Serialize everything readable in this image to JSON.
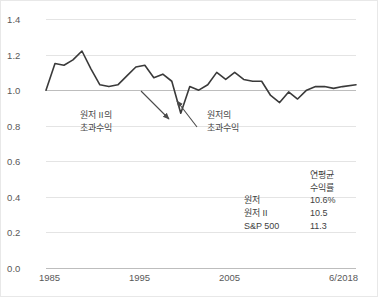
{
  "chart_data": {
    "type": "line",
    "title": "",
    "xlabel": "",
    "ylabel": "",
    "ylim": [
      0.0,
      1.4
    ],
    "ytick_labels": [
      "0.0",
      "0.2",
      "0.4",
      "0.6",
      "0.8",
      "1.0",
      "1.2",
      "1.4"
    ],
    "ytick_values": [
      0.0,
      0.2,
      0.4,
      0.6,
      0.8,
      1.0,
      1.2,
      1.4
    ],
    "xtick_labels": [
      "1985",
      "1995",
      "2005",
      "6/2018"
    ],
    "xtick_values": [
      1985,
      1995,
      2005,
      2018.5
    ],
    "xlim": [
      1984.0,
      2018.5
    ],
    "grid": true,
    "legend_position": "inside-bottom-right",
    "reference_line": 1.0,
    "series": [
      {
        "name": "relative-ratio",
        "x": [
          1984.0,
          1985.0,
          1986.0,
          1987.0,
          1988.0,
          1989.0,
          1990.0,
          1991.0,
          1992.0,
          1993.0,
          1994.0,
          1995.0,
          1996.0,
          1997.0,
          1998.0,
          1999.0,
          2000.0,
          2001.0,
          2002.0,
          2003.0,
          2004.0,
          2005.0,
          2006.0,
          2007.0,
          2008.0,
          2009.0,
          2010.0,
          2011.0,
          2012.0,
          2013.0,
          2014.0,
          2015.0,
          2016.0,
          2017.0,
          2018.5
        ],
        "values": [
          1.0,
          1.15,
          1.14,
          1.17,
          1.22,
          1.12,
          1.03,
          1.02,
          1.03,
          1.08,
          1.13,
          1.14,
          1.07,
          1.09,
          1.05,
          0.87,
          1.02,
          1.0,
          1.03,
          1.1,
          1.06,
          1.1,
          1.06,
          1.05,
          1.05,
          0.97,
          0.93,
          0.99,
          0.95,
          1.0,
          1.02,
          1.02,
          1.01,
          1.02,
          1.03
        ]
      }
    ],
    "annotations": [
      {
        "id": "left-annotation",
        "line1": "원저 II의",
        "line2": "초과수익"
      },
      {
        "id": "right-annotation",
        "line1": "원저의",
        "line2": "초과수익"
      }
    ],
    "legend_table": {
      "header_line1": "연평균",
      "header_line2": "수익률",
      "rows": [
        {
          "label": "원저",
          "value": "10.6%"
        },
        {
          "label": "원저 II",
          "value": "10.5"
        },
        {
          "label": "S&P 500",
          "value": "11.3"
        }
      ]
    },
    "colors": {
      "line": "#3a3a3a",
      "reference_line": "#9a9a9a",
      "grid": "#e4e4e4",
      "text": "#595959",
      "background": "#ffffff",
      "frame": "#e8e8e8"
    }
  }
}
